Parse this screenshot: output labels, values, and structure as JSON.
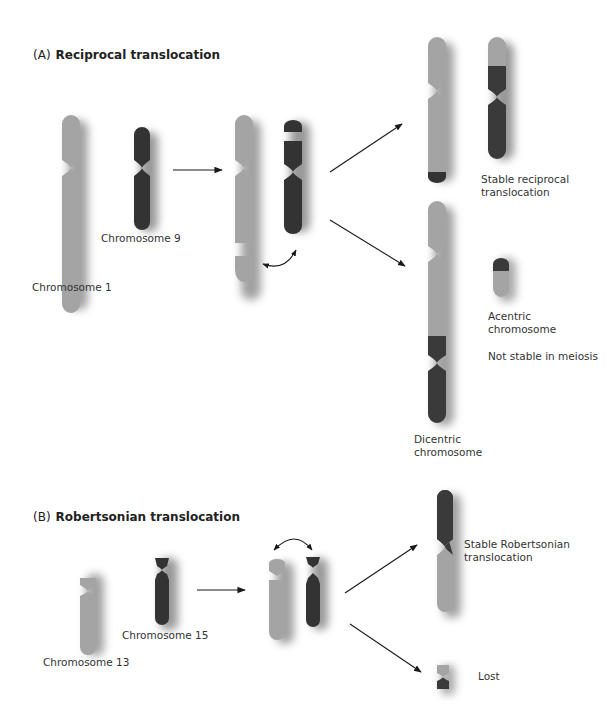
{
  "colors": {
    "gray_chromosome": "#a4a4a4",
    "dark_chromosome": "#3a3a3a",
    "shadow": "#555555",
    "arrow": "#1a1a1a",
    "background": "#ffffff"
  },
  "panel_a": {
    "tag": "(A)",
    "title": "Reciprocal translocation",
    "labels": {
      "chromosome_1": "Chromosome 1",
      "chromosome_9": "Chromosome 9",
      "stable_line1": "Stable reciprocal",
      "stable_line2": "translocation",
      "acentric_line1": "Acentric",
      "acentric_line2": "chromosome",
      "not_stable": "Not stable in meiosis",
      "dicentric_line1": "Dicentric",
      "dicentric_line2": "chromosome"
    }
  },
  "panel_b": {
    "tag": "(B)",
    "title": "Robertsonian translocation",
    "labels": {
      "chromosome_13": "Chromosome 13",
      "chromosome_15": "Chromosome 15",
      "stable_line1": "Stable Robertsonian",
      "stable_line2": "translocation",
      "lost": "Lost"
    }
  }
}
